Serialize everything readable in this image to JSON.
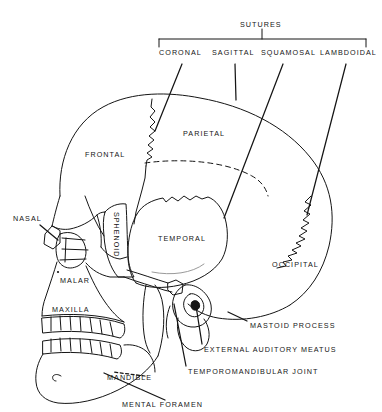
{
  "figure": {
    "type": "anatomical-diagram",
    "background_color": "#ffffff",
    "line_color": "#151515",
    "text_color": "#151515"
  },
  "suture_group": {
    "heading": "SUTURES",
    "items": [
      {
        "label": "CORONAL",
        "x": 159,
        "y": 55
      },
      {
        "label": "SAGITTAL",
        "x": 212,
        "y": 55
      },
      {
        "label": "SQUAMOSAL",
        "x": 261,
        "y": 55
      },
      {
        "label": "LAMBDOIDAL",
        "x": 320,
        "y": 55
      }
    ]
  },
  "bone_labels": [
    {
      "name": "FRONTAL",
      "x": 85,
      "y": 152,
      "orientation": "horizontal"
    },
    {
      "name": "PARIETAL",
      "x": 183,
      "y": 132,
      "orientation": "horizontal"
    },
    {
      "name": "TEMPORAL",
      "x": 158,
      "y": 237,
      "orientation": "horizontal"
    },
    {
      "name": "OCCIPITAL",
      "x": 272,
      "y": 263,
      "orientation": "horizontal"
    },
    {
      "name": "SPHENOID",
      "x": 115,
      "y": 218,
      "orientation": "vertical"
    },
    {
      "name": "NASAL",
      "x": 14,
      "y": 217,
      "orientation": "horizontal"
    },
    {
      "name": "MALAR",
      "x": 60,
      "y": 279,
      "orientation": "horizontal"
    },
    {
      "name": "MAXILLA",
      "x": 52,
      "y": 308,
      "orientation": "horizontal"
    },
    {
      "name": "MANDIBLE",
      "x": 107,
      "y": 376,
      "orientation": "horizontal"
    }
  ],
  "feature_labels": [
    {
      "name": "MASTOID PROCESS",
      "x": 250,
      "y": 324
    },
    {
      "name": "EXTERNAL  AUDITORY  MEATUS",
      "x": 204,
      "y": 348
    },
    {
      "name": "TEMPOROMANDIBULAR  JOINT",
      "x": 188,
      "y": 370
    },
    {
      "name": "MENTAL  FORAMEN",
      "x": 122,
      "y": 403
    }
  ]
}
